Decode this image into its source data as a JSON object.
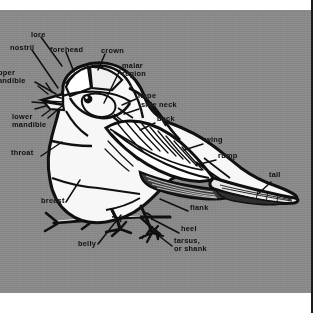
{
  "figure": {
    "style": "black-and-white line illustration on gray scanned page",
    "background_color": "#8a8a8a",
    "ink_color": "#101010",
    "paper_color": "#ffffff",
    "plate": {
      "x": 0,
      "y": 10,
      "width": 311,
      "height": 283
    },
    "page_rule": {
      "x": 311,
      "width": 2,
      "color": "#1b1b1b"
    }
  },
  "labels": [
    {
      "id": "lore",
      "text": "lore",
      "x": 31,
      "y": 28,
      "align": "left"
    },
    {
      "id": "nostril",
      "text": "nostril",
      "x": 10,
      "y": 42,
      "align": "left"
    },
    {
      "id": "forehead",
      "text": "forehead",
      "x": 50,
      "y": 44,
      "align": "left"
    },
    {
      "id": "crown",
      "text": "crown",
      "x": 101,
      "y": 45,
      "align": "left"
    },
    {
      "id": "malar-region",
      "text": "malar\nregion",
      "x": 122,
      "y": 60,
      "align": "left"
    },
    {
      "id": "upper-mandible",
      "text": "pper\nandible",
      "x": 0,
      "y": 67,
      "align": "left"
    },
    {
      "id": "nape",
      "text": "nape",
      "x": 138,
      "y": 90,
      "align": "left"
    },
    {
      "id": "side-neck",
      "text": "side neck",
      "x": 141,
      "y": 99,
      "align": "left"
    },
    {
      "id": "lower-mandible",
      "text": "lower\nmandible",
      "x": 12,
      "y": 111,
      "align": "left"
    },
    {
      "id": "back",
      "text": "back",
      "x": 157,
      "y": 113,
      "align": "left"
    },
    {
      "id": "throat",
      "text": "throat",
      "x": 11,
      "y": 147,
      "align": "left"
    },
    {
      "id": "wing",
      "text": "wing",
      "x": 205,
      "y": 134,
      "align": "left"
    },
    {
      "id": "rump",
      "text": "rump",
      "x": 218,
      "y": 150,
      "align": "left"
    },
    {
      "id": "tail",
      "text": "tail",
      "x": 269,
      "y": 169,
      "align": "left"
    },
    {
      "id": "breast",
      "text": "breast",
      "x": 41,
      "y": 195,
      "align": "left"
    },
    {
      "id": "flank",
      "text": "flank",
      "x": 190,
      "y": 202,
      "align": "left"
    },
    {
      "id": "belly",
      "text": "belly",
      "x": 78,
      "y": 238,
      "align": "left"
    },
    {
      "id": "heel",
      "text": "heel",
      "x": 181,
      "y": 223,
      "align": "left"
    },
    {
      "id": "tarsus-or-shank",
      "text": "tarsus,\nor shank",
      "x": 174,
      "y": 235,
      "align": "left"
    }
  ]
}
